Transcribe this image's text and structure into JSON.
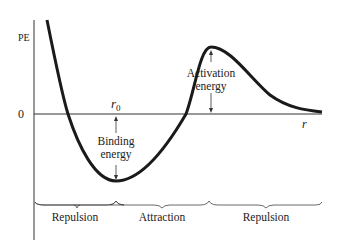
{
  "diagram": {
    "y_axis_label": "PE",
    "zero_label": "0",
    "x_axis_label": "r",
    "r0_label": "r",
    "r0_subscript": "0",
    "binding_energy": [
      "Binding",
      "energy"
    ],
    "activation_energy": [
      "Activation",
      "energy"
    ],
    "regions": [
      {
        "label": "Repulsion"
      },
      {
        "label": "Attraction"
      },
      {
        "label": "Repulsion"
      }
    ],
    "colors": {
      "curve": "#1a1a1a",
      "axis": "#333333",
      "text": "#222222",
      "background": "#ffffff"
    }
  }
}
